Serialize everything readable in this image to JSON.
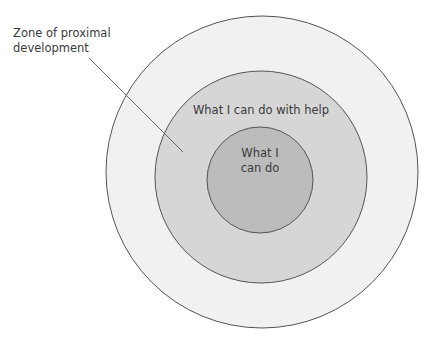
{
  "diagram": {
    "type": "concentric-circles",
    "colors": {
      "outer_fill": "#f1f1f1",
      "middle_fill": "#d6d6d6",
      "inner_fill": "#bcbcbc",
      "stroke": "#555555",
      "text": "#3a3a3a"
    },
    "outer_label_line1": "Zone of proximal",
    "outer_label_line2": "development",
    "middle_label": "What I can do with help",
    "inner_label_line1": "What I",
    "inner_label_line2": "can do"
  }
}
